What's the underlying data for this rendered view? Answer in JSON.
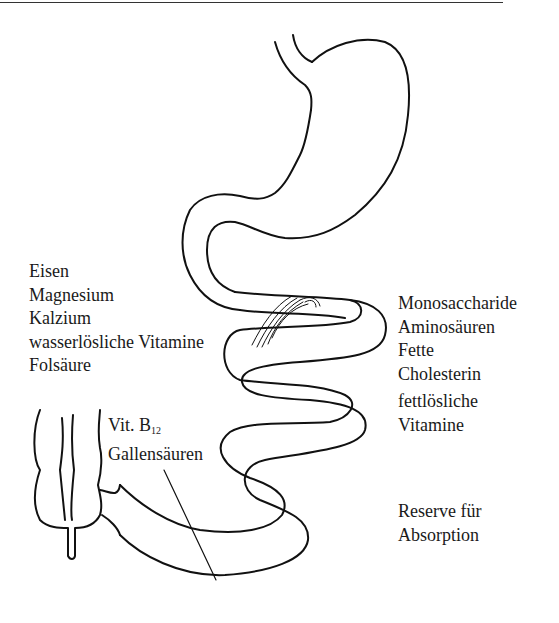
{
  "diagram": {
    "left_labels": [
      "Eisen",
      "Magnesium",
      "Kalzium",
      "wasserlösliche Vitamine",
      "Folsäure"
    ],
    "ileum_labels": {
      "vit_b_prefix": "Vit. B",
      "vit_b_subscript": "12",
      "bile": "Gallensäuren"
    },
    "right_labels": [
      "Monosaccharide",
      "Aminosäuren",
      "Fette",
      "Cholesterin"
    ],
    "right_labels_2": [
      "fettlösliche",
      "Vitamine"
    ],
    "reserve_labels": [
      "Reserve für",
      "Absorption"
    ],
    "structures": [
      "esophagus",
      "stomach",
      "duodenum",
      "jejunum",
      "ileum",
      "colon"
    ],
    "line_color": "#111111"
  }
}
